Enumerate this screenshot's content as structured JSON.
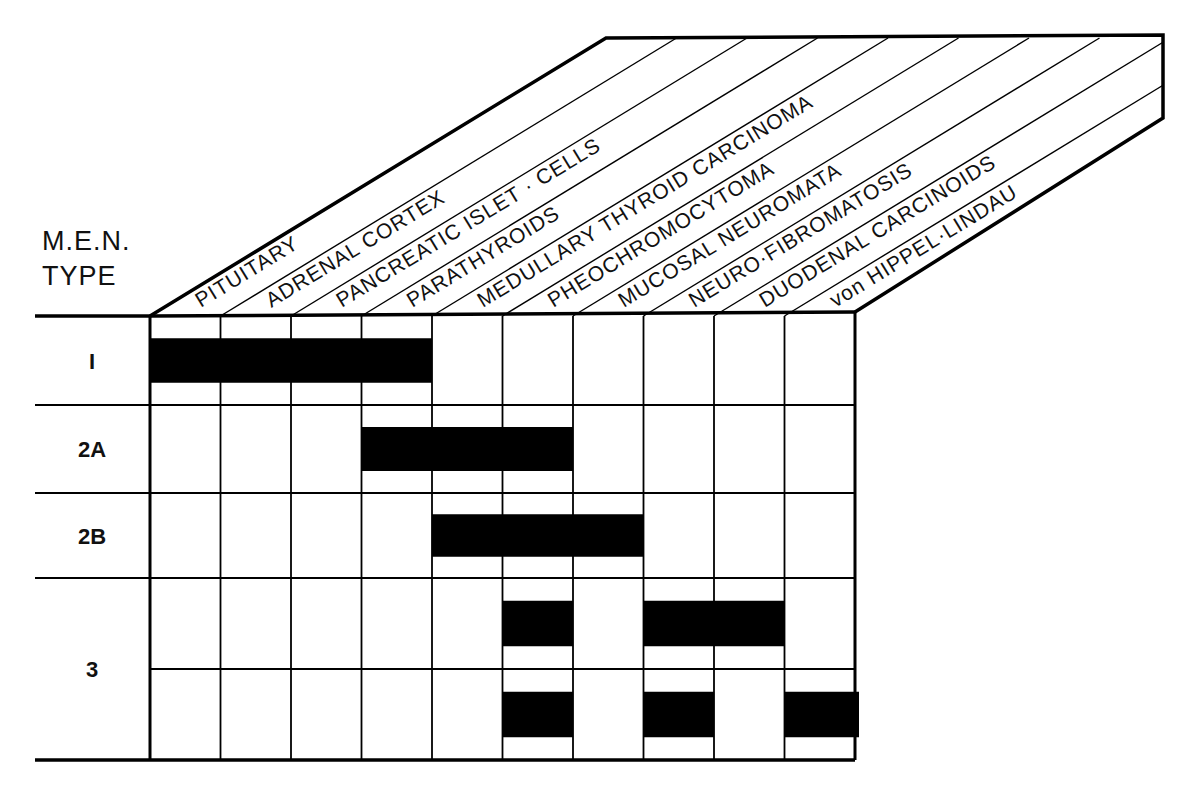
{
  "title": {
    "line1": "M.E.N.",
    "line2": "TYPE"
  },
  "columns": [
    "PITUITARY",
    "ADRENAL CORTEX",
    "PANCREATIC ISLET · CELLS",
    "PARATHYROIDS",
    "MEDULLARY THYROID CARCINOMA",
    "PHEOCHROMOCYTOMA",
    "MUCOSAL NEUROMATA",
    "NEURO·FIBROMATOSIS",
    "DUODENAL CARCINOIDS",
    "von HIPPEL·LINDAU"
  ],
  "rows": [
    {
      "label": "I",
      "subrows": [
        {
          "spans": [
            [
              0,
              3
            ]
          ]
        }
      ]
    },
    {
      "label": "2A",
      "subrows": [
        {
          "spans": [
            [
              3,
              5
            ]
          ]
        }
      ]
    },
    {
      "label": "2B",
      "subrows": [
        {
          "spans": [
            [
              4,
              6
            ]
          ]
        }
      ]
    },
    {
      "label": "3",
      "subrows": [
        {
          "spans": [
            [
              5,
              5
            ],
            [
              7,
              8
            ]
          ]
        },
        {
          "spans": [
            [
              5,
              5
            ],
            [
              7,
              7
            ],
            [
              9,
              9
            ]
          ]
        }
      ]
    }
  ],
  "colors": {
    "ink": "#000000",
    "paper": "#ffffff"
  }
}
